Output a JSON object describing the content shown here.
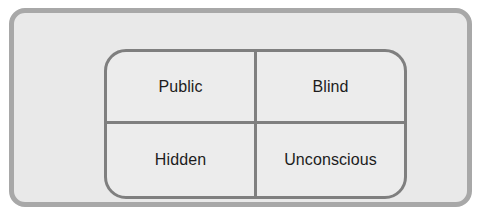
{
  "diagram": {
    "frame": {
      "fill_color": "#e9e9e9",
      "border_color": "#a8a8a8"
    },
    "grid": {
      "fill_color": "#ececec",
      "border_color": "#7f7f7f",
      "divider_color": "#7f7f7f",
      "text_color": "#1c1c1c"
    },
    "quadrants": [
      {
        "id": "public",
        "label": "Public",
        "position": "top-left"
      },
      {
        "id": "blind",
        "label": "Blind",
        "position": "top-right"
      },
      {
        "id": "hidden",
        "label": "Hidden",
        "position": "bottom-left"
      },
      {
        "id": "unconscious",
        "label": "Unconscious",
        "position": "bottom-right"
      }
    ]
  }
}
